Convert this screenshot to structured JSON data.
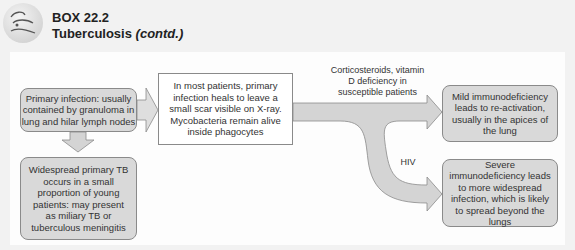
{
  "header": {
    "box_label": "BOX 22.2",
    "title": "Tuberculosis",
    "title_suffix": "(contd.)",
    "icon": "lungs-logo-icon"
  },
  "diagram": {
    "nodes": {
      "primary": "Primary infection: usually contained by granuloma in lung and hilar lymph nodes",
      "heals": "In most patients, primary infection heals to leave a small scar visible on X-ray. Mycobacteria remain alive inside phagocytes",
      "widespread": "Widespread primary TB occurs in a small proportion of young patients: may present as miliary TB or tuberculous meningitis",
      "mild": "Mild immunodeficiency leads to re-activation, usually in the apices of the lung",
      "severe": "Severe immunodeficiency leads to more widespread infection, which is likely to spread beyond the lungs"
    },
    "edge_labels": {
      "mild": "Corticosteroids, vitamin D deficiency in susceptible patients",
      "severe": "HIV"
    },
    "colors": {
      "node_fill": "#d9d9d9",
      "node_border": "#8a8a8a",
      "arrow_fill": "#d4d4d4",
      "panel_bg": "#fdfdfd",
      "page_bg": "#f2f2f2"
    }
  }
}
